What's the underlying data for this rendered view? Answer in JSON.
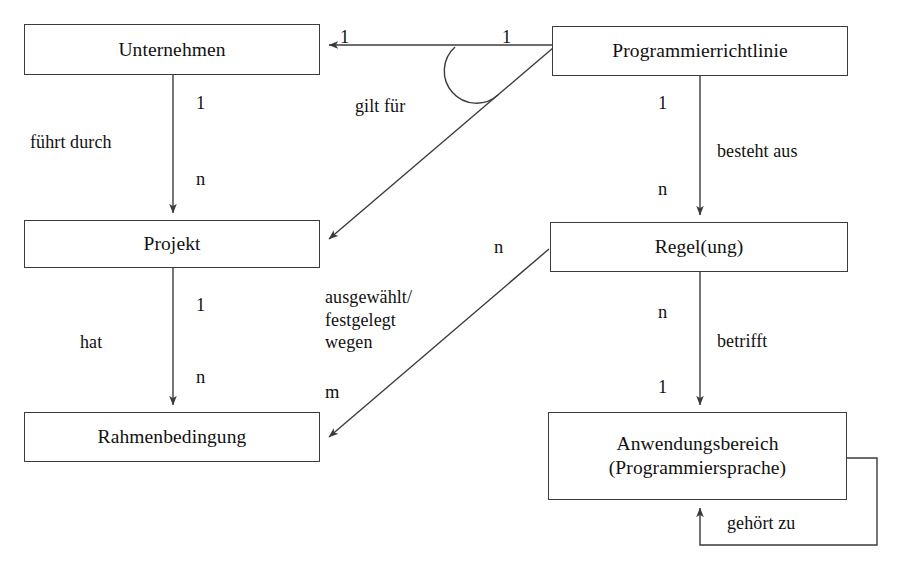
{
  "diagram": {
    "type": "entity-relationship-diagram",
    "language": "de",
    "background_color": "#ffffff",
    "line_color": "#3b3b3b",
    "text_color": "#111111"
  },
  "entities": [
    {
      "id": "unternehmen",
      "label": "Unternehmen"
    },
    {
      "id": "programmierrichtlinie",
      "label": "Programmierrichtlinie"
    },
    {
      "id": "projekt",
      "label": "Projekt"
    },
    {
      "id": "regelung",
      "label": "Regel(ung)"
    },
    {
      "id": "rahmenbedingung",
      "label": "Rahmenbedingung"
    },
    {
      "id": "anwendungsbereich",
      "label": "Anwendungsbereich\n(Programmiersprache)"
    }
  ],
  "relationships": [
    {
      "id": "fuehrt-durch",
      "label": "führt durch",
      "from": "unternehmen",
      "to": "projekt",
      "from_card": "1",
      "to_card": "n"
    },
    {
      "id": "hat",
      "label": "hat",
      "from": "projekt",
      "to": "rahmenbedingung",
      "from_card": "1",
      "to_card": "n"
    },
    {
      "id": "gilt-fuer",
      "label": "gilt für",
      "from": "programmierrichtlinie",
      "to": "unternehmen",
      "from_card": "1",
      "to_card": "1"
    },
    {
      "id": "gilt-fuer-projekt",
      "label": "",
      "from": "programmierrichtlinie",
      "to": "projekt",
      "from_card": "",
      "to_card": ""
    },
    {
      "id": "besteht-aus",
      "label": "besteht aus",
      "from": "programmierrichtlinie",
      "to": "regelung",
      "from_card": "1",
      "to_card": "n"
    },
    {
      "id": "betrifft",
      "label": "betrifft",
      "from": "regelung",
      "to": "anwendungsbereich",
      "from_card": "n",
      "to_card": "1"
    },
    {
      "id": "ausgewaehlt",
      "label": "ausgewählt/\nfestgelegt\nwegen",
      "from": "regelung",
      "to": "rahmenbedingung",
      "from_card": "n",
      "to_card": "m"
    },
    {
      "id": "gehoert-zu",
      "label": "gehört zu",
      "from": "anwendungsbereich",
      "to": "anwendungsbereich",
      "from_card": "",
      "to_card": ""
    }
  ],
  "labels": {
    "fuehrt_durch": "führt durch",
    "hat": "hat",
    "gilt_fuer": "gilt für",
    "besteht_aus": "besteht aus",
    "betrifft": "betrifft",
    "ausgewaehlt_festgelegt_wegen": "ausgewählt/\nfestgelegt\nwegen",
    "gehoert_zu": "gehört zu"
  },
  "cardinalities": {
    "unternehmen_projekt_top": "1",
    "unternehmen_projekt_bottom": "n",
    "projekt_rahmen_top": "1",
    "projekt_rahmen_bottom": "n",
    "gilt_fuer_target": "1",
    "gilt_fuer_source": "1",
    "besteht_aus_top": "1",
    "besteht_aus_bottom": "n",
    "betrifft_top": "n",
    "betrifft_bottom": "1",
    "ausgewaehlt_source": "n",
    "ausgewaehlt_target": "m"
  }
}
